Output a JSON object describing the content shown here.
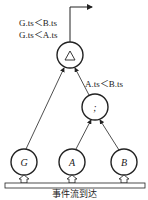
{
  "diagram": {
    "nodes": [
      {
        "id": "and",
        "label": "△",
        "x": 70,
        "y": 55
      },
      {
        "id": "seq",
        "label": ";",
        "x": 95,
        "y": 107
      },
      {
        "id": "G",
        "label": "G",
        "x": 24,
        "y": 162
      },
      {
        "id": "A",
        "label": "A",
        "x": 72,
        "y": 162
      },
      {
        "id": "B",
        "label": "B",
        "x": 124,
        "y": 162
      }
    ],
    "edges": [
      {
        "from": "G",
        "to": "and"
      },
      {
        "from": "seq",
        "to": "and"
      },
      {
        "from": "A",
        "to": "seq"
      },
      {
        "from": "B",
        "to": "seq"
      }
    ],
    "conditions": {
      "top_1": "G.ts＜B.ts",
      "top_2": "G.ts＜A.ts",
      "seq": "A.ts＜B.ts"
    },
    "caption": "事件流到达"
  }
}
